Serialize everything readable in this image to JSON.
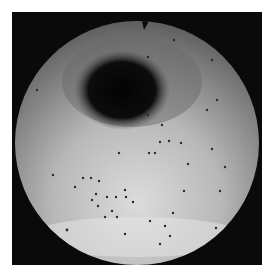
{
  "image": {
    "description": "Circular grayscale endoscopic view with dark lumen and scattered dark dots",
    "colors": {
      "background": "#ffffff",
      "frame": "#0a0a0a",
      "tissue_light": "#d8d8d8",
      "tissue_mid": "#8a8a8a",
      "lumen": "#050505",
      "dot": "#2a2a2a"
    }
  }
}
